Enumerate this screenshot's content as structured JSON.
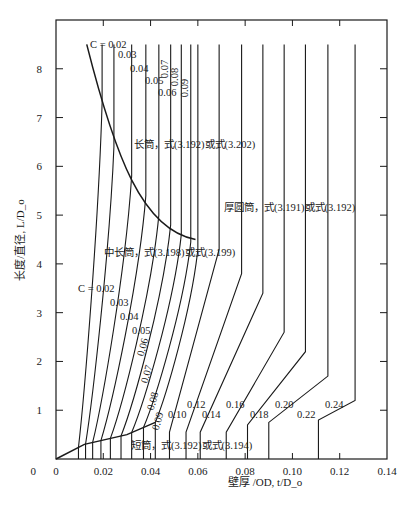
{
  "chart_data": {
    "type": "line",
    "title": "",
    "xlabel": "壁厚 /OD, t/D_o",
    "ylabel": "长度/直径, L/D_o",
    "xlim": [
      0,
      0.14
    ],
    "ylim": [
      0,
      9
    ],
    "x_ticks": [
      "0",
      "0.02",
      "0.04",
      "0.06",
      "0.08",
      "0.10",
      "0.12",
      "0.14"
    ],
    "y_ticks": [
      "0",
      "1",
      "2",
      "3",
      "4",
      "5",
      "6",
      "7",
      "8"
    ],
    "grid": false,
    "regions": [
      {
        "name": "long",
        "label": "长筒，式(3.192)或式(3.202)"
      },
      {
        "name": "thick",
        "label": "厚圆筒，式(3.191)或式(3.192)"
      },
      {
        "name": "intermediate",
        "label": "中长筒，式(3.198)或式(3.199)"
      },
      {
        "name": "short",
        "label": "短筒，式(3.192)或式(3.194)"
      }
    ],
    "c_label_prefix": "C = ",
    "series": [
      {
        "name": "0.02",
        "top_x": 0.0195,
        "knee_y": 7.3,
        "bottom_x": 0.0095
      },
      {
        "name": "0.03",
        "top_x": 0.0245,
        "knee_y": 6.4,
        "bottom_x": 0.0125
      },
      {
        "name": "0.04",
        "top_x": 0.032,
        "knee_y": 5.8,
        "bottom_x": 0.0155
      },
      {
        "name": "0.05",
        "top_x": 0.038,
        "knee_y": 5.4,
        "bottom_x": 0.019
      },
      {
        "name": "0.06",
        "top_x": 0.0435,
        "knee_y": 5.0,
        "bottom_x": 0.023
      },
      {
        "name": "0.07",
        "top_x": 0.0485,
        "knee_y": 4.8,
        "bottom_x": 0.0275
      },
      {
        "name": "0.08",
        "top_x": 0.053,
        "knee_y": 4.6,
        "bottom_x": 0.032
      },
      {
        "name": "0.09",
        "top_x": 0.057,
        "knee_y": 4.45,
        "bottom_x": 0.037
      },
      {
        "name": "0.10",
        "top_x": 0.06,
        "knee_y": 4.3,
        "bottom_x": 0.042
      },
      {
        "name": "0.12",
        "top_x": 0.069,
        "knee_y": 4.3,
        "bottom_x": 0.048
      },
      {
        "name": "0.14",
        "top_x": 0.0785,
        "knee_y": 3.8,
        "bottom_x": 0.055
      },
      {
        "name": "0.16",
        "top_x": 0.0875,
        "knee_y": 3.4,
        "bottom_x": 0.061
      },
      {
        "name": "0.18",
        "top_x": 0.0965,
        "knee_y": 2.6,
        "bottom_x": 0.072
      },
      {
        "name": "0.20",
        "top_x": 0.1055,
        "knee_y": 2.2,
        "bottom_x": 0.081
      },
      {
        "name": "0.22",
        "top_x": 0.115,
        "knee_y": 1.7,
        "bottom_x": 0.09
      },
      {
        "name": "0.24",
        "top_x": 0.1265,
        "knee_y": 1.2,
        "bottom_x": 0.111
      }
    ],
    "long_boundary": [
      [
        0.013,
        8.5
      ],
      [
        0.025,
        6.4
      ],
      [
        0.045,
        4.6
      ],
      [
        0.059,
        4.5
      ]
    ],
    "short_boundary": [
      [
        0.0,
        0.0
      ],
      [
        0.012,
        0.3
      ],
      [
        0.03,
        0.5
      ],
      [
        0.042,
        0.75
      ]
    ]
  }
}
